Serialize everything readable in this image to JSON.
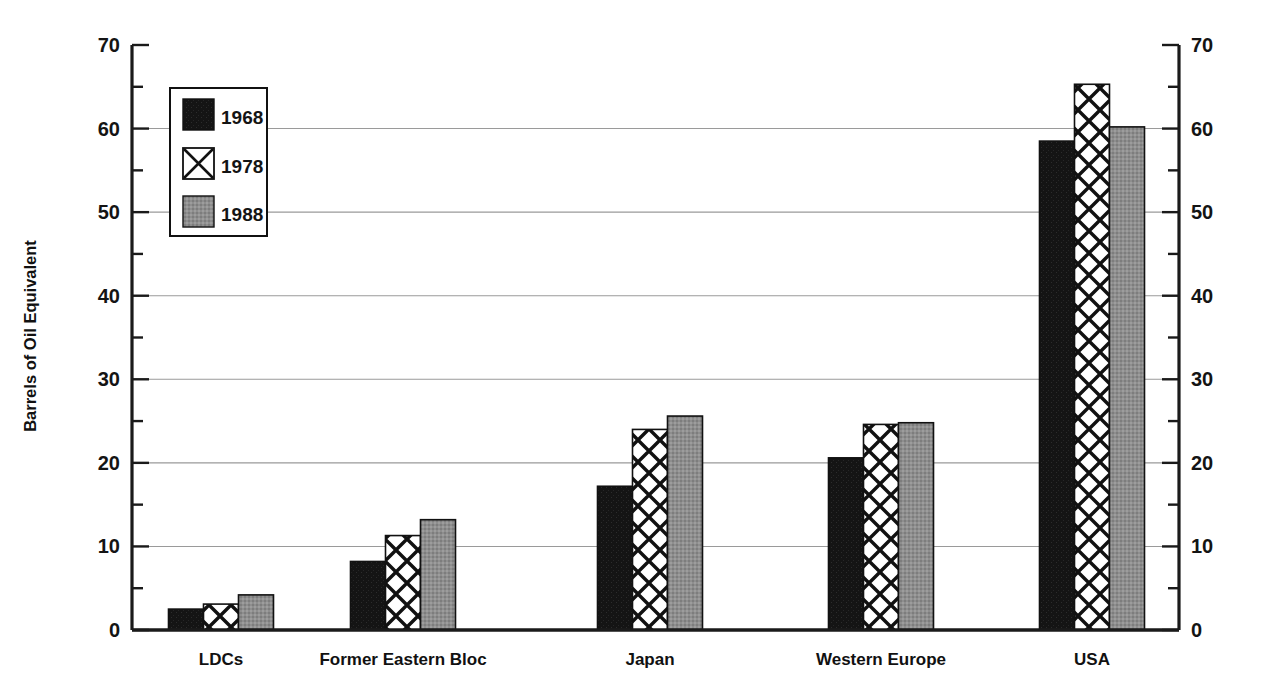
{
  "chart_data": {
    "type": "bar",
    "title": "",
    "subtitle": "",
    "xlabel": "",
    "ylabel": "Barrels of Oil Equivalent",
    "ylim": [
      0,
      70
    ],
    "ytick_step": 10,
    "yminor_step": 5,
    "ytick_labels": [
      "0",
      "10",
      "20",
      "30",
      "40",
      "50",
      "60",
      "70"
    ],
    "ytick_values": [
      0,
      10,
      20,
      30,
      40,
      50,
      60,
      70
    ],
    "grid": "horizontal-major",
    "dual_y_axis": true,
    "legend_position": "upper-left-inside",
    "categories": [
      "LDCs",
      "Former Eastern Bloc",
      "Japan",
      "Western Europe",
      "USA"
    ],
    "series": [
      {
        "name": "1968",
        "fill": "#1a1a1a",
        "pattern": "solid-black",
        "values": [
          2.5,
          8.2,
          17.2,
          20.6,
          58.5
        ]
      },
      {
        "name": "1978",
        "fill": "#ffffff",
        "pattern": "crosshatch",
        "values": [
          3.1,
          11.3,
          24.0,
          24.6,
          65.3
        ]
      },
      {
        "name": "1988",
        "fill": "#8c8c8c",
        "pattern": "gray-stipple",
        "values": [
          4.2,
          13.2,
          25.6,
          24.8,
          60.2
        ]
      }
    ]
  },
  "legend": {
    "entries": [
      {
        "label": "1968",
        "swatch": "solid-black"
      },
      {
        "label": "1978",
        "swatch": "single-x"
      },
      {
        "label": "1988",
        "swatch": "gray-stipple"
      }
    ]
  },
  "colors": {
    "series_1968": "#1a1a1a",
    "series_1978": "#ffffff",
    "series_1988": "#8c8c8c",
    "axis": "#1a1a1a",
    "gridline": "#9a9a9a",
    "background": "#ffffff"
  }
}
